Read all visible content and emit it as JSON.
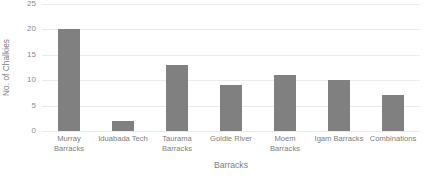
{
  "chart_data": {
    "type": "bar",
    "title": "",
    "xlabel": "Barracks",
    "ylabel": "No. of Chalkies",
    "categories": [
      "Murray Barracks",
      "Iduabada Tech",
      "Taurama Barracks",
      "Goldie River",
      "Moem Barracks",
      "Igam Barracks",
      "Combinations"
    ],
    "values": [
      20,
      2,
      13,
      9,
      11,
      10,
      7
    ],
    "ylim": [
      0,
      25
    ],
    "yticks": [
      0,
      5,
      10,
      15,
      20,
      25
    ],
    "ytick_labels": [
      "0",
      "5",
      "10",
      "15",
      "20",
      "25"
    ],
    "grid": true,
    "grid_axis": "y",
    "legend": false,
    "legend_position": "none",
    "bar_color": "#808080",
    "gridline_color": "#eaeaea",
    "text_color": "#7d7d7d",
    "background": "#ffffff"
  }
}
